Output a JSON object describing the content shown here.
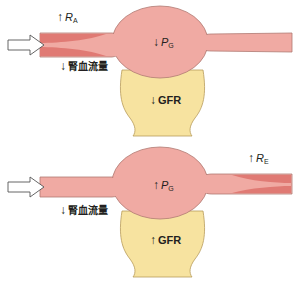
{
  "colors": {
    "vessel": "#f0aaa3",
    "vessel_stroke": "#b07a72",
    "constriction": "#e07a74",
    "capsule": "#f7e3a0",
    "capsule_stroke": "#b89c5c",
    "text": "#231f20"
  },
  "panels": [
    {
      "id": "afferent-constriction",
      "resistance_label": {
        "arrow": "↑",
        "symbol": "R",
        "subscript": "A"
      },
      "blood_flow_label": {
        "arrow": "↓",
        "text": "腎血流量"
      },
      "glomerular_pressure_label": {
        "arrow": "↓",
        "symbol": "P",
        "subscript": "G"
      },
      "gfr_label": {
        "arrow": "↓",
        "text": "GFR"
      }
    },
    {
      "id": "efferent-constriction",
      "resistance_label": {
        "arrow": "↑",
        "symbol": "R",
        "subscript": "E"
      },
      "blood_flow_label": {
        "arrow": "↓",
        "text": "腎血流量"
      },
      "glomerular_pressure_label": {
        "arrow": "↑",
        "symbol": "P",
        "subscript": "G"
      },
      "gfr_label": {
        "arrow": "↑",
        "text": "GFR"
      }
    }
  ]
}
